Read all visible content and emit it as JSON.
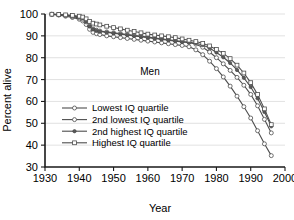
{
  "chart_data": {
    "type": "line",
    "title": "",
    "annotation": "Men",
    "xlabel": "Year",
    "ylabel": "Percent alive",
    "xlim": [
      1930,
      2000
    ],
    "ylim": [
      30,
      100
    ],
    "xticks": [
      1930,
      1940,
      1950,
      1960,
      1970,
      1980,
      1990,
      2000
    ],
    "yticks": [
      30,
      40,
      50,
      60,
      70,
      80,
      90,
      100
    ],
    "grid": "horizontal",
    "legend_position": "inside-lower-left",
    "series": [
      {
        "name": "Lowest IQ quartile",
        "marker": "open-circle",
        "color": "#4d4d4d",
        "x": [
          1932,
          1934,
          1936,
          1938,
          1940,
          1941,
          1942,
          1943,
          1944,
          1945,
          1946,
          1948,
          1950,
          1952,
          1954,
          1956,
          1958,
          1960,
          1962,
          1964,
          1966,
          1968,
          1970,
          1972,
          1974,
          1976,
          1978,
          1980,
          1982,
          1984,
          1986,
          1988,
          1990,
          1992,
          1994,
          1996
        ],
        "values": [
          99.8,
          99.5,
          99.0,
          98.4,
          97.6,
          96.8,
          95.2,
          93.0,
          91.6,
          91.0,
          90.6,
          90.0,
          89.6,
          89.2,
          88.8,
          88.4,
          88.0,
          87.6,
          87.2,
          86.8,
          86.4,
          86.0,
          85.6,
          85.0,
          83.6,
          81.4,
          78.4,
          75.0,
          71.2,
          67.0,
          62.4,
          57.6,
          52.4,
          46.6,
          40.6,
          35.2
        ]
      },
      {
        "name": "2nd lowest IQ quartile",
        "marker": "open-circle",
        "color": "#4d4d4d",
        "x": [
          1932,
          1934,
          1936,
          1938,
          1940,
          1941,
          1942,
          1943,
          1944,
          1945,
          1946,
          1948,
          1950,
          1952,
          1954,
          1956,
          1958,
          1960,
          1962,
          1964,
          1966,
          1968,
          1970,
          1972,
          1974,
          1976,
          1978,
          1980,
          1982,
          1984,
          1986,
          1988,
          1990,
          1992,
          1994,
          1996
        ],
        "values": [
          99.9,
          99.7,
          99.3,
          98.8,
          98.2,
          97.6,
          96.4,
          94.6,
          93.2,
          92.6,
          92.2,
          91.8,
          91.4,
          91.0,
          90.6,
          90.2,
          89.8,
          89.4,
          89.0,
          88.6,
          88.2,
          87.8,
          87.4,
          87.0,
          86.2,
          84.8,
          82.6,
          80.0,
          77.2,
          74.2,
          71.0,
          67.4,
          63.2,
          58.0,
          51.8,
          45.6
        ]
      },
      {
        "name": "2nd highest IQ quartile",
        "marker": "filled-circle",
        "color": "#595959",
        "x": [
          1932,
          1934,
          1936,
          1938,
          1940,
          1941,
          1942,
          1943,
          1944,
          1945,
          1946,
          1948,
          1950,
          1952,
          1954,
          1956,
          1958,
          1960,
          1962,
          1964,
          1966,
          1968,
          1970,
          1972,
          1974,
          1976,
          1978,
          1980,
          1982,
          1984,
          1986,
          1988,
          1990,
          1992,
          1994,
          1996
        ],
        "values": [
          99.9,
          99.8,
          99.5,
          99.1,
          98.6,
          98.0,
          96.6,
          94.4,
          93.0,
          92.4,
          92.0,
          91.6,
          91.2,
          90.8,
          90.4,
          90.0,
          89.6,
          89.2,
          88.8,
          88.4,
          88.0,
          87.6,
          87.2,
          87.0,
          86.6,
          85.8,
          84.4,
          82.4,
          80.2,
          77.6,
          74.4,
          70.8,
          66.6,
          61.4,
          55.2,
          48.6
        ]
      },
      {
        "name": "Highest IQ quartile",
        "marker": "open-square",
        "color": "#4d4d4d",
        "x": [
          1932,
          1934,
          1936,
          1938,
          1940,
          1941,
          1942,
          1943,
          1944,
          1945,
          1946,
          1948,
          1950,
          1952,
          1954,
          1956,
          1958,
          1960,
          1962,
          1964,
          1966,
          1968,
          1970,
          1972,
          1974,
          1976,
          1978,
          1980,
          1982,
          1984,
          1986,
          1988,
          1990,
          1992,
          1994,
          1996
        ],
        "values": [
          99.9,
          99.8,
          99.6,
          99.4,
          99.0,
          98.6,
          97.8,
          96.6,
          95.8,
          95.4,
          95.0,
          94.4,
          93.8,
          93.2,
          92.6,
          92.0,
          91.4,
          90.8,
          90.4,
          90.0,
          89.6,
          89.2,
          88.6,
          88.0,
          87.4,
          86.6,
          85.4,
          83.8,
          82.0,
          79.6,
          76.6,
          73.0,
          68.6,
          63.2,
          56.6,
          49.4
        ]
      }
    ]
  },
  "legend": {
    "items": [
      {
        "label": "Lowest IQ quartile",
        "marker": "open-circle"
      },
      {
        "label": "2nd lowest IQ quartile",
        "marker": "open-circle"
      },
      {
        "label": "2nd highest IQ quartile",
        "marker": "filled-circle"
      },
      {
        "label": "Highest IQ quartile",
        "marker": "open-square"
      }
    ]
  }
}
